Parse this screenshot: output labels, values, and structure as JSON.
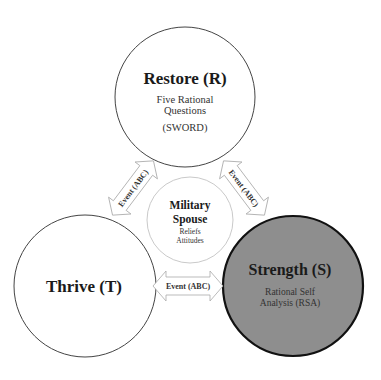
{
  "diagram": {
    "nodes": {
      "restore": {
        "title": "Restore (R)",
        "line1": "Five Rational",
        "line2": "Questions",
        "line3": "(SWORD)",
        "fill": "#ffffff",
        "stroke": "#444444"
      },
      "thrive": {
        "title": "Thrive (T)",
        "fill": "#ffffff",
        "stroke": "#444444"
      },
      "strength": {
        "title": "Strength (S)",
        "line1": "Rational Self",
        "line2": "Analysis (RSA)",
        "fill": "#8e8e8e",
        "stroke": "#111111"
      },
      "center": {
        "title_line1": "Military",
        "title_line2": "Spouse",
        "line1": "Reliefs",
        "line2": "Attitudes",
        "fill": "#ffffff",
        "stroke": "#bbbbbb"
      }
    },
    "arrows": {
      "left": {
        "label": "Event (ABC)",
        "connects": [
          "thrive",
          "restore"
        ]
      },
      "right": {
        "label": "Event (ABC)",
        "connects": [
          "restore",
          "strength"
        ]
      },
      "bottom": {
        "label": "Event (ABC)",
        "connects": [
          "thrive",
          "strength"
        ]
      }
    },
    "arrow_stroke": "#aaaaaa"
  }
}
